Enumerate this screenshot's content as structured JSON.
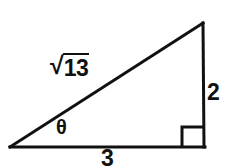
{
  "figure": {
    "kind": "right-triangle-diagram",
    "background_color": "#ffffff",
    "stroke_color": "#111111",
    "stroke_width": 3,
    "vertices": {
      "left": [
        10,
        147
      ],
      "bottom_right": [
        204,
        147
      ],
      "apex": [
        204,
        23
      ]
    },
    "right_angle_marker": {
      "at_vertex": "bottom_right",
      "size": 21
    },
    "labels": {
      "hypotenuse": {
        "radical_glyph": "√",
        "radicand": "13",
        "full_text": "√13"
      },
      "angle": "θ",
      "opposite_leg": "2",
      "adjacent_leg": "3"
    }
  }
}
